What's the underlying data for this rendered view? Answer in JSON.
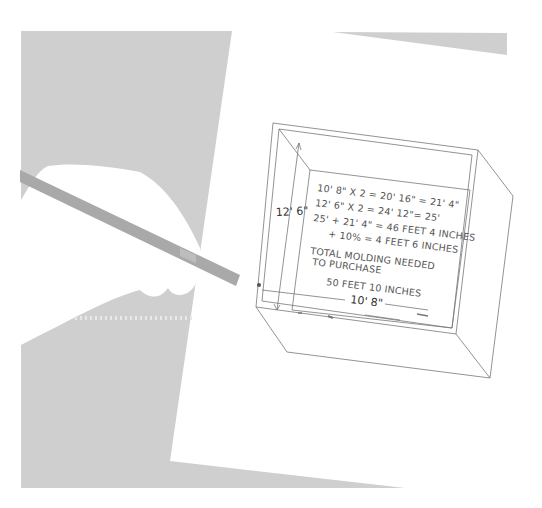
{
  "illustration": {
    "subject": "hand with pencil calculating molding for a room drawn in perspective",
    "colors": {
      "background": "#ffffff",
      "table_gray": "#cfcfcf",
      "pencil_gray": "#a9a9a9",
      "line": "#777777",
      "text": "#555555"
    },
    "dimensions": {
      "height_label": "12' 6\"",
      "width_label": "10' 8\""
    },
    "calculation_lines": [
      "10' 8\" X 2 = 20' 16\" = 21' 4\"",
      "12' 6\" X 2 = 24' 12\"= 25'",
      "25' + 21' 4\" = 46 FEET 4 INCHES",
      "+ 10% = 4 FEET 6 INCHES",
      "TOTAL MOLDING NEEDED",
      "TO PURCHASE",
      "50 FEET 10 INCHES"
    ]
  }
}
